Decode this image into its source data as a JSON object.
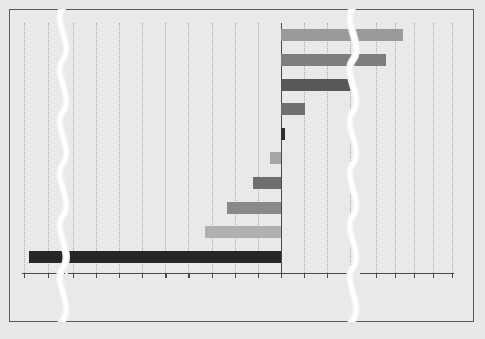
{
  "chart_data": {
    "type": "bar",
    "orientation": "horizontal",
    "title": "",
    "xlabel": "Billions of dollars",
    "ylabel": "",
    "grid": true,
    "legend_position": "none",
    "broken_axis": true,
    "annotations": [
      {
        "text": "Negative net exports",
        "position": "top-left"
      },
      {
        "text": "Positive net exports",
        "position": "top-right"
      }
    ],
    "axis_segments": [
      {
        "name": "far-negative",
        "ticks": [
          -700,
          -600
        ],
        "labels": [
          "-700",
          "-600"
        ]
      },
      {
        "name": "main",
        "ticks": [
          -180,
          -160,
          -140,
          -120,
          -100,
          -80,
          -60,
          -40,
          -20,
          0,
          20,
          40,
          60
        ],
        "labels": [
          "-180",
          "",
          "-140",
          "",
          "-100",
          "",
          "-60",
          "",
          "-20",
          "0",
          "20",
          "",
          "60"
        ]
      },
      {
        "name": "far-positive",
        "ticks": [
          200,
          400,
          600
        ],
        "labels": [
          "200",
          "400",
          "600"
        ]
      }
    ],
    "categories": [
      "China",
      "Germany",
      "South Korea",
      "Mexico",
      "United Kingdom",
      "Japan",
      "Bangladesh",
      "Canada",
      "France",
      "United States"
    ],
    "values": [
      340,
      250,
      62,
      21,
      4,
      -9,
      -24,
      -47,
      -66,
      -680
    ],
    "colors": [
      "#9a9a9a",
      "#7e7e7e",
      "#585858",
      "#6e6e6e",
      "#2e2e2e",
      "#a6a6a6",
      "#6e6e6e",
      "#8a8a8a",
      "#b0b0b0",
      "#262626"
    ],
    "bar_colors_note": "alternating gray shades"
  },
  "xaxis_tick_labels": {
    "far_negative": [
      "-700",
      "-600"
    ],
    "main": [
      "-180",
      "-140",
      "-100",
      "-60",
      "-20",
      "0",
      "20",
      "60"
    ],
    "far_positive": [
      "200",
      "400",
      "600"
    ]
  },
  "headers": {
    "negative": "Negative net exports",
    "positive": "Positive net exports"
  },
  "axis": {
    "x_title": "Billions of dollars"
  },
  "labels": {
    "c0": "China",
    "c1": "Germany",
    "c2": "South Korea",
    "c3": "Mexico",
    "c4": "United Kingdom",
    "c5": "Japan",
    "c6": "Bangladesh",
    "c7": "Canada",
    "c8": "France",
    "c9": "United States"
  },
  "ticks": {
    "t_700": "-700",
    "t_600": "600",
    "t_180": "-180",
    "t_140": "-140",
    "t_100": "-100",
    "t_60n": "-60",
    "t_20n": "-20",
    "t_0": "0",
    "t_20p": "20",
    "t_60p": "60",
    "t_200": "200",
    "t_400": "400"
  },
  "colors": {
    "frame": "#5a5a5a",
    "background": "#e9e9e7",
    "page": "#e8e8e6",
    "grid": "#aaaaa8",
    "axis": "#4a4a4a"
  }
}
